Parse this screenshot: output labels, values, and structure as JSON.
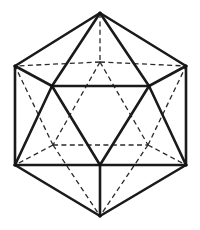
{
  "figure": {
    "name": "icosahedron-wireframe",
    "type": "polyhedron-line-drawing",
    "shape": "icosahedron",
    "orientation": "vertex-up / 3-fold axis toward viewer",
    "projection": "orthographic",
    "background_color": "#ffffff",
    "visible_edge_color": "#1a1a1a",
    "hidden_edge_color": "#2a2a2a",
    "visible_edge_width": 2.6,
    "hidden_edge_width": 1.3,
    "hidden_edge_style": "dashed",
    "vertex_count": 12,
    "edge_count": 30,
    "face_count": 20,
    "canvas": {
      "width": 200,
      "height": 230
    }
  },
  "vertices": {
    "top_apex": {
      "label": "top-apex",
      "x": 100,
      "y": 13,
      "hidden": false
    },
    "bottom_apex": {
      "label": "bottom-apex",
      "x": 100,
      "y": 216,
      "hidden": false
    },
    "upper_left": {
      "label": "upper-left",
      "x": 15,
      "y": 66,
      "hidden": false
    },
    "upper_right": {
      "label": "upper-right",
      "x": 186,
      "y": 66,
      "hidden": false
    },
    "lower_left": {
      "label": "lower-left",
      "x": 15,
      "y": 165,
      "hidden": false
    },
    "lower_right": {
      "label": "lower-right",
      "x": 186,
      "y": 165,
      "hidden": false
    },
    "front_left": {
      "label": "front-left",
      "x": 52,
      "y": 86,
      "hidden": false
    },
    "front_right": {
      "label": "front-right",
      "x": 149,
      "y": 86,
      "hidden": false
    },
    "front_bottom": {
      "label": "front-bottom",
      "x": 100,
      "y": 165,
      "hidden": false
    },
    "back_top": {
      "label": "back-top",
      "x": 100,
      "y": 62,
      "hidden": true
    },
    "back_left": {
      "label": "back-left",
      "x": 53,
      "y": 145,
      "hidden": true
    },
    "back_right": {
      "label": "back-right",
      "x": 148,
      "y": 145,
      "hidden": true
    }
  },
  "edges": {
    "visible": [
      {
        "name": "outline-top-apex-to-upper-left",
        "from": "top_apex",
        "to": "upper_left"
      },
      {
        "name": "outline-top-apex-to-upper-right",
        "from": "top_apex",
        "to": "upper_right"
      },
      {
        "name": "outline-upper-left-to-lower-left",
        "from": "upper_left",
        "to": "lower_left"
      },
      {
        "name": "outline-upper-right-to-lower-right",
        "from": "upper_right",
        "to": "lower_right"
      },
      {
        "name": "outline-lower-left-to-bottom-apex",
        "from": "lower_left",
        "to": "bottom_apex"
      },
      {
        "name": "outline-lower-right-to-bottom-apex",
        "from": "lower_right",
        "to": "bottom_apex"
      },
      {
        "name": "top-apex-to-front-left",
        "from": "top_apex",
        "to": "front_left"
      },
      {
        "name": "top-apex-to-front-right",
        "from": "top_apex",
        "to": "front_right"
      },
      {
        "name": "upper-left-to-front-left",
        "from": "upper_left",
        "to": "front_left"
      },
      {
        "name": "upper-right-to-front-right",
        "from": "upper_right",
        "to": "front_right"
      },
      {
        "name": "front-left-to-front-right",
        "from": "front_left",
        "to": "front_right"
      },
      {
        "name": "front-left-to-front-bottom",
        "from": "front_left",
        "to": "front_bottom"
      },
      {
        "name": "front-right-to-front-bottom",
        "from": "front_right",
        "to": "front_bottom"
      },
      {
        "name": "front-left-to-lower-left",
        "from": "front_left",
        "to": "lower_left"
      },
      {
        "name": "front-right-to-lower-right",
        "from": "front_right",
        "to": "lower_right"
      },
      {
        "name": "lower-left-to-front-bottom",
        "from": "lower_left",
        "to": "front_bottom"
      },
      {
        "name": "lower-right-to-front-bottom",
        "from": "lower_right",
        "to": "front_bottom"
      },
      {
        "name": "front-bottom-to-bottom-apex",
        "from": "front_bottom",
        "to": "bottom_apex"
      }
    ],
    "hidden": [
      {
        "name": "top-apex-to-back-top",
        "from": "top_apex",
        "to": "back_top"
      },
      {
        "name": "back-top-to-upper-left",
        "from": "back_top",
        "to": "upper_left"
      },
      {
        "name": "back-top-to-upper-right",
        "from": "back_top",
        "to": "upper_right"
      },
      {
        "name": "back-top-to-back-left",
        "from": "back_top",
        "to": "back_left"
      },
      {
        "name": "back-top-to-back-right",
        "from": "back_top",
        "to": "back_right"
      },
      {
        "name": "back-left-to-back-right",
        "from": "back_left",
        "to": "back_right"
      },
      {
        "name": "back-left-to-upper-left",
        "from": "back_left",
        "to": "upper_left"
      },
      {
        "name": "back-right-to-upper-right",
        "from": "back_right",
        "to": "upper_right"
      },
      {
        "name": "back-left-to-lower-left",
        "from": "back_left",
        "to": "lower_left"
      },
      {
        "name": "back-right-to-lower-right",
        "from": "back_right",
        "to": "lower_right"
      },
      {
        "name": "back-left-to-bottom-apex",
        "from": "back_left",
        "to": "bottom_apex"
      },
      {
        "name": "back-right-to-bottom-apex",
        "from": "back_right",
        "to": "bottom_apex"
      }
    ]
  }
}
